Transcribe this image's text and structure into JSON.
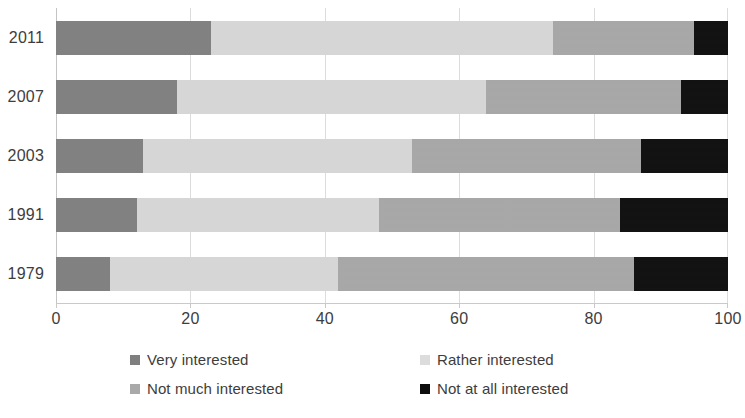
{
  "chart_data": {
    "type": "bar",
    "orientation": "horizontal",
    "stacked": true,
    "stack_mode": "percent",
    "title": "",
    "subtitle": "",
    "xlabel": "",
    "ylabel": "",
    "xlim": [
      0,
      100
    ],
    "grid": true,
    "legend_position": "bottom",
    "categories": [
      "2011",
      "2007",
      "2003",
      "1991",
      "1979"
    ],
    "x_ticks": [
      0,
      20,
      40,
      60,
      80,
      100
    ],
    "x_tick_labels": [
      "0",
      "20",
      "40",
      "60",
      "80",
      "100"
    ],
    "series": [
      {
        "name": "Very interested",
        "color": "#7f7f7f",
        "values": [
          23,
          18,
          13,
          12,
          8
        ]
      },
      {
        "name": "Rather interested",
        "color": "#dcdcdc",
        "values": [
          51,
          46,
          40,
          36,
          34
        ]
      },
      {
        "name": "Not much interested",
        "color": "#a9a9a9",
        "values": [
          21,
          29,
          34,
          36,
          44
        ]
      },
      {
        "name": "Not at all interested",
        "color": "#0d0d0d",
        "values": [
          5,
          7,
          13,
          16,
          14
        ]
      }
    ]
  },
  "legend": {
    "items": [
      {
        "label": "Very interested",
        "color": "#7f7f7f"
      },
      {
        "label": "Rather interested",
        "color": "#dcdcdc"
      },
      {
        "label": "Not much interested",
        "color": "#a9a9a9"
      },
      {
        "label": "Not at all interested",
        "color": "#0d0d0d"
      }
    ]
  }
}
